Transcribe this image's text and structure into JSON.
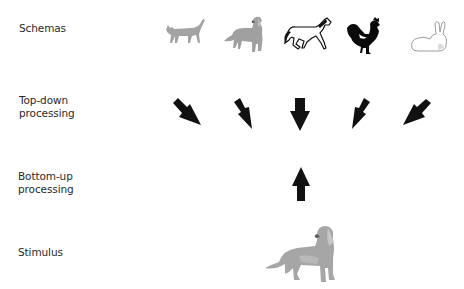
{
  "diagram": {
    "type": "schema-processing",
    "rows": [
      {
        "id": "schemas",
        "label": "Schemas"
      },
      {
        "id": "top_down",
        "label_line1": "Top-down",
        "label_line2": "processing"
      },
      {
        "id": "bottom_up",
        "label_line1": "Bottom-up",
        "label_line2": "processing"
      },
      {
        "id": "stimulus",
        "label": "Stimulus"
      }
    ],
    "schemas": [
      {
        "name": "cat",
        "icon": "cat-icon",
        "color": "#9a9a9a"
      },
      {
        "name": "dog",
        "icon": "dog-icon",
        "color": "#9c9c9c"
      },
      {
        "name": "horse",
        "icon": "horse-icon",
        "color": "#111111"
      },
      {
        "name": "rooster",
        "icon": "rooster-icon",
        "color": "#000000"
      },
      {
        "name": "rabbit",
        "icon": "rabbit-icon",
        "color": "#bbbbbb"
      }
    ],
    "top_down_arrows": [
      {
        "direction": "down-right"
      },
      {
        "direction": "down-slight-right"
      },
      {
        "direction": "down"
      },
      {
        "direction": "down-slight-left"
      },
      {
        "direction": "down-left"
      }
    ],
    "bottom_up_arrow": {
      "direction": "up"
    },
    "stimulus": {
      "name": "dog",
      "icon": "dog-icon"
    },
    "arrow_color": "#111111"
  }
}
